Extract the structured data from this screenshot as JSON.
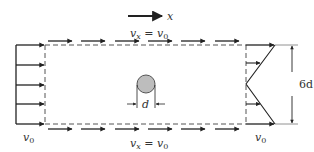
{
  "diagram": {
    "axis_label": "x",
    "top_label": {
      "var": "v",
      "sub": "x",
      "eq": " = ",
      "rhs": "v",
      "rhs_sub": "0"
    },
    "bottom_label": {
      "var": "v",
      "sub": "x",
      "eq": " = ",
      "rhs": "v",
      "rhs_sub": "0"
    },
    "inlet_label": {
      "var": "v",
      "sub": "0"
    },
    "outlet_label": {
      "var": "v",
      "sub": "0"
    },
    "diameter_label": "d",
    "height_label": "6d",
    "colors": {
      "line": "#222222",
      "dashed": "#555555",
      "cylinder_fill": "#bdbdbd",
      "cylinder_stroke": "#555555"
    }
  }
}
